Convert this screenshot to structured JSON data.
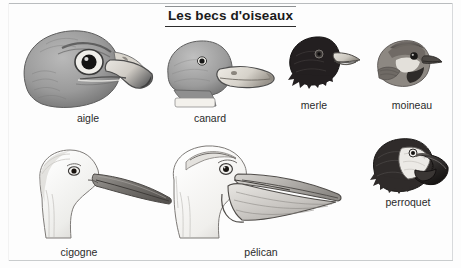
{
  "page": {
    "title": "Les becs d'oiseaux",
    "background_color": "#fdfdfd",
    "text_color": "#231f20",
    "rule_color": "#2b2b2b"
  },
  "figures": [
    {
      "id": "aigle",
      "label": "aigle",
      "icon": "eagle-head-illustration",
      "beak_type": "crochu",
      "tone": "#8e8e8e"
    },
    {
      "id": "canard",
      "label": "canard",
      "icon": "duck-head-illustration",
      "beak_type": "plat et large",
      "tone": "#9a9a9a"
    },
    {
      "id": "merle",
      "label": "merle",
      "icon": "blackbird-head-illustration",
      "beak_type": "fin et pointu",
      "tone": "#231f20"
    },
    {
      "id": "moineau",
      "label": "moineau",
      "icon": "sparrow-head-illustration",
      "beak_type": "court et conique",
      "tone": "#6e6e6e"
    },
    {
      "id": "cigogne",
      "label": "cigogne",
      "icon": "stork-head-illustration",
      "beak_type": "long et pointu",
      "tone": "#f2f2f2"
    },
    {
      "id": "pelican",
      "label": "pélican",
      "icon": "pelican-head-illustration",
      "beak_type": "avec poche",
      "tone": "#fafafa"
    },
    {
      "id": "perroquet",
      "label": "perroquet",
      "icon": "parrot-head-illustration",
      "beak_type": "crochu et massif",
      "tone": "#3a3a3a"
    }
  ]
}
